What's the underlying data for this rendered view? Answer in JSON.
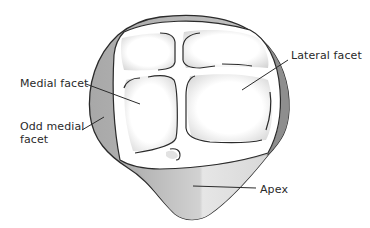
{
  "figure": {
    "labels": {
      "medial_facet": "Medial facet",
      "lateral_facet": "Lateral facet",
      "odd_medial_facet_line1": "Odd medial",
      "odd_medial_facet_line2": "facet",
      "apex": "Apex"
    },
    "colors": {
      "outline": "#2b2b2b",
      "shade_dark": "#9a9a9a",
      "shade_mid": "#bdbdbd",
      "shade_light": "#dedede",
      "facet_fill": "#ffffff",
      "text": "#2a2a2a"
    }
  }
}
